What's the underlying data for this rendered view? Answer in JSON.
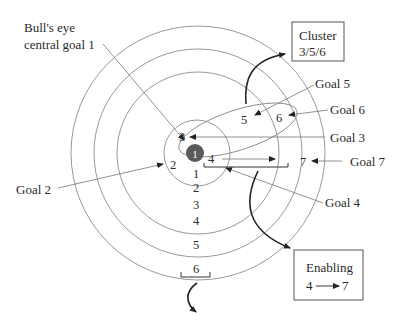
{
  "diagram": {
    "title_label": {
      "line1": "Bull's eye",
      "line2": "central goal 1"
    },
    "bullseye_number": "1",
    "ring_numbers": [
      "1",
      "2",
      "3",
      "4",
      "5",
      "6"
    ],
    "inner_labels": {
      "two": "2",
      "three": "3",
      "four": "4",
      "five": "5",
      "six": "6",
      "seven": "7"
    },
    "goal_labels": {
      "goal2": "Goal 2",
      "goal3": "Goal 3",
      "goal4": "Goal 4",
      "goal5": "Goal 5",
      "goal6": "Goal 6",
      "goal7": "Goal 7"
    },
    "cluster_box": {
      "line1": "Cluster",
      "line2": "3/5/6"
    },
    "enabling_box": {
      "line1": "Enabling",
      "from": "4",
      "to": "7"
    },
    "colors": {
      "bullseye": "#5a5a5a",
      "rings": "#8c8c8c",
      "text": "#2a2a2a"
    }
  }
}
